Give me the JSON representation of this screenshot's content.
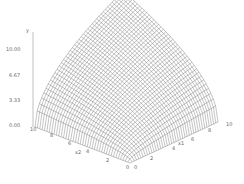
{
  "chart_data": {
    "type": "surface",
    "title": "",
    "zlabel": "y",
    "x1label": "x1",
    "x2label": "x2",
    "z_ticks": [
      "0.00",
      "3.33",
      "6.67",
      "10.00"
    ],
    "x1_ticks": [
      "0",
      "2",
      "4",
      "6",
      "8",
      "10"
    ],
    "x2_ticks": [
      "10",
      "8",
      "6",
      "4",
      "2",
      "0"
    ],
    "x1_range": [
      0,
      10
    ],
    "x2_range": [
      0,
      10
    ],
    "z_range": [
      0,
      10
    ],
    "function": "y = sqrt(x1 * x2)",
    "grid_resolution": 40,
    "colors": {
      "mesh": "#555555",
      "axis": "#999999",
      "text": "#666666"
    }
  }
}
